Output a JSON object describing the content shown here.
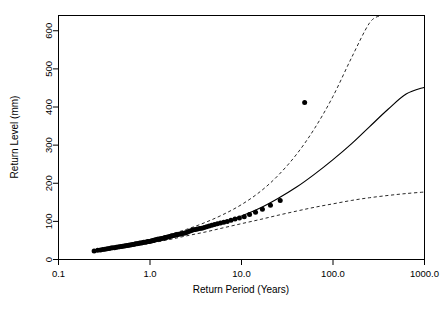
{
  "chart_data": {
    "type": "scatter",
    "title": "",
    "xlabel": "Return Period (Years)",
    "ylabel": "Return Level (mm)",
    "xscale": "log",
    "yscale": "linear",
    "xlim": [
      0.1,
      1000.0
    ],
    "ylim": [
      0,
      640
    ],
    "grid": false,
    "legend": "none",
    "xticks": [
      0.1,
      1.0,
      10.0,
      100.0,
      1000.0
    ],
    "xticklabels": [
      "0.1",
      "1.0",
      "10.0",
      "100.0",
      "1000.0"
    ],
    "yticks": [
      0,
      100,
      200,
      300,
      400,
      500,
      600
    ],
    "yticklabels": [
      "0",
      "100",
      "200",
      "300",
      "400",
      "500",
      "600"
    ],
    "series": [
      {
        "name": "Empirical return levels",
        "type": "scatter",
        "marker": "filled-circle",
        "color": "#000000",
        "points": [
          [
            0.245,
            22
          ],
          [
            0.268,
            24
          ],
          [
            0.288,
            25
          ],
          [
            0.305,
            26
          ],
          [
            0.322,
            27
          ],
          [
            0.34,
            28
          ],
          [
            0.358,
            29
          ],
          [
            0.375,
            30
          ],
          [
            0.392,
            30.5
          ],
          [
            0.41,
            31
          ],
          [
            0.428,
            32
          ],
          [
            0.446,
            33
          ],
          [
            0.465,
            33.5
          ],
          [
            0.484,
            34
          ],
          [
            0.503,
            35
          ],
          [
            0.523,
            35.5
          ],
          [
            0.543,
            36
          ],
          [
            0.563,
            37
          ],
          [
            0.584,
            37.5
          ],
          [
            0.605,
            38
          ],
          [
            0.627,
            39
          ],
          [
            0.65,
            39.5
          ],
          [
            0.673,
            40
          ],
          [
            0.697,
            41
          ],
          [
            0.721,
            41.5
          ],
          [
            0.746,
            42
          ],
          [
            0.772,
            43
          ],
          [
            0.799,
            43.5
          ],
          [
            0.826,
            44
          ],
          [
            0.855,
            45
          ],
          [
            0.884,
            45.5
          ],
          [
            0.915,
            46
          ],
          [
            0.946,
            47
          ],
          [
            0.979,
            47.5
          ],
          [
            1.013,
            48
          ],
          [
            1.048,
            49
          ],
          [
            1.085,
            50
          ],
          [
            1.123,
            51
          ],
          [
            1.163,
            52
          ],
          [
            1.204,
            53
          ],
          [
            1.248,
            53.5
          ],
          [
            1.293,
            54
          ],
          [
            1.341,
            55
          ],
          [
            1.391,
            56
          ],
          [
            1.443,
            57
          ],
          [
            1.498,
            58
          ],
          [
            1.556,
            59
          ],
          [
            1.617,
            60
          ],
          [
            1.681,
            61
          ],
          [
            1.749,
            62
          ],
          [
            1.82,
            63
          ],
          [
            1.896,
            64
          ],
          [
            1.976,
            65
          ],
          [
            2.061,
            66
          ],
          [
            2.151,
            67
          ],
          [
            2.247,
            68
          ],
          [
            2.349,
            69
          ],
          [
            2.458,
            70
          ],
          [
            2.575,
            72
          ],
          [
            2.7,
            74
          ],
          [
            2.835,
            76
          ],
          [
            2.98,
            78
          ],
          [
            3.137,
            79
          ],
          [
            3.307,
            80
          ],
          [
            3.492,
            81
          ],
          [
            3.694,
            82
          ],
          [
            3.915,
            84
          ],
          [
            4.159,
            86
          ],
          [
            4.429,
            88
          ],
          [
            4.731,
            90
          ],
          [
            5.07,
            92
          ],
          [
            5.453,
            94
          ],
          [
            5.89,
            96
          ],
          [
            6.393,
            98
          ],
          [
            6.978,
            100
          ],
          [
            7.667,
            103
          ],
          [
            8.489,
            106
          ],
          [
            9.484,
            109
          ],
          [
            10.71,
            112
          ],
          [
            12.25,
            118
          ],
          [
            14.24,
            124
          ],
          [
            16.92,
            132
          ],
          [
            20.72,
            142
          ],
          [
            26.5,
            155
          ],
          [
            49.0,
            412
          ]
        ]
      },
      {
        "name": "Modelled return level (fit)",
        "type": "line",
        "style": "solid",
        "color": "#000000",
        "points": [
          [
            0.25,
            23
          ],
          [
            0.4,
            31
          ],
          [
            0.6,
            37
          ],
          [
            1.0,
            47
          ],
          [
            1.6,
            58
          ],
          [
            2.5,
            69
          ],
          [
            4.0,
            83
          ],
          [
            6.3,
            97
          ],
          [
            10.0,
            114
          ],
          [
            16.0,
            135
          ],
          [
            25.0,
            160
          ],
          [
            40.0,
            190
          ],
          [
            63.0,
            224
          ],
          [
            100.0,
            262
          ],
          [
            160.0,
            304
          ],
          [
            250.0,
            348
          ],
          [
            400.0,
            394
          ],
          [
            630.0,
            434
          ],
          [
            1000.0,
            452
          ]
        ]
      },
      {
        "name": "Upper 95% confidence limit",
        "type": "line",
        "style": "dashed",
        "color": "#000000",
        "points": [
          [
            0.25,
            25
          ],
          [
            0.4,
            34
          ],
          [
            0.6,
            41
          ],
          [
            1.0,
            52
          ],
          [
            1.6,
            65
          ],
          [
            2.5,
            79
          ],
          [
            4.0,
            97
          ],
          [
            6.3,
            118
          ],
          [
            10.0,
            144
          ],
          [
            16.0,
            178
          ],
          [
            25.0,
            220
          ],
          [
            40.0,
            276
          ],
          [
            63.0,
            344
          ],
          [
            100.0,
            428
          ],
          [
            160.0,
            530
          ],
          [
            250.0,
            620
          ],
          [
            330.0,
            640
          ]
        ]
      },
      {
        "name": "Lower 95% confidence limit",
        "type": "line",
        "style": "dashed",
        "color": "#000000",
        "points": [
          [
            0.25,
            20
          ],
          [
            0.4,
            28
          ],
          [
            0.6,
            34
          ],
          [
            1.0,
            43
          ],
          [
            1.6,
            52
          ],
          [
            2.5,
            62
          ],
          [
            4.0,
            72
          ],
          [
            6.3,
            83
          ],
          [
            10.0,
            94
          ],
          [
            16.0,
            105
          ],
          [
            25.0,
            116
          ],
          [
            40.0,
            127
          ],
          [
            63.0,
            137
          ],
          [
            100.0,
            146
          ],
          [
            160.0,
            155
          ],
          [
            250.0,
            162
          ],
          [
            400.0,
            168
          ],
          [
            630.0,
            173
          ],
          [
            1000.0,
            177
          ]
        ]
      }
    ],
    "annotations": [
      {
        "name": "outlier-point",
        "x": 49.0,
        "y": 412,
        "note": "isolated high observation well above the fitted curve"
      }
    ]
  }
}
